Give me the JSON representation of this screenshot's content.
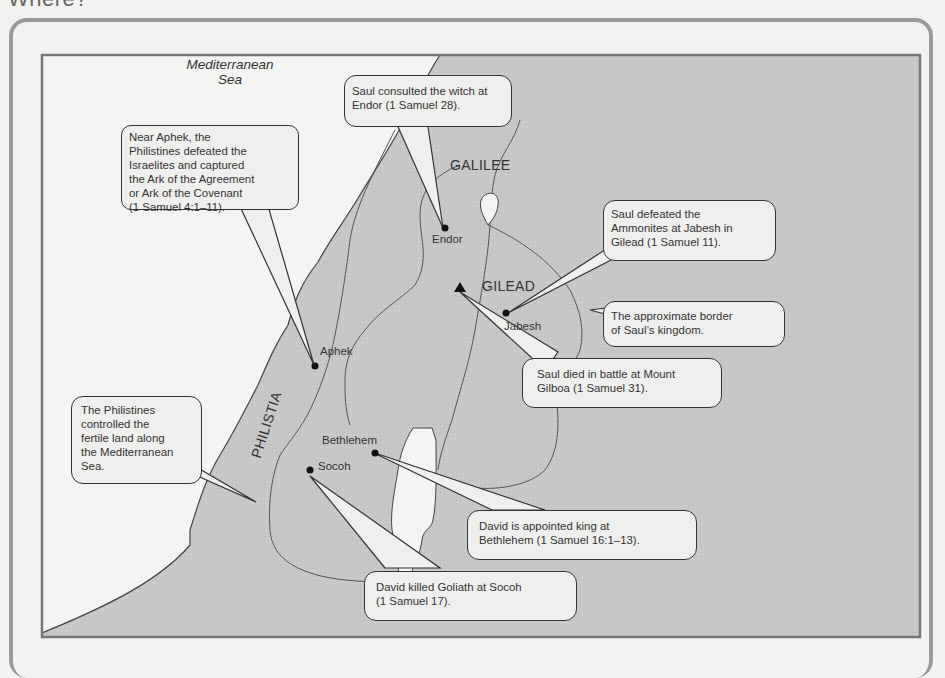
{
  "heading": "Where?",
  "colors": {
    "land": "#c7c7c7",
    "sea": "#f4f4f2",
    "border_line": "#555555",
    "frame": "#777777",
    "callout_fill": "#efefed",
    "callout_stroke": "#333333",
    "marker": "#111111"
  },
  "map": {
    "sea_label": "Mediterranean\nSea",
    "regions": [
      {
        "id": "galilee",
        "label": "GALILEE"
      },
      {
        "id": "gilead",
        "label": "GILEAD"
      },
      {
        "id": "philistia",
        "label": "PHILISTIA"
      }
    ],
    "places": [
      {
        "id": "endor",
        "label": "Endor",
        "marker": "dot"
      },
      {
        "id": "mount-gilboa",
        "label": "",
        "marker": "triangle"
      },
      {
        "id": "jabesh",
        "label": "Jabesh",
        "marker": "dot"
      },
      {
        "id": "aphek",
        "label": "Aphek",
        "marker": "dot"
      },
      {
        "id": "bethlehem",
        "label": "Bethlehem",
        "marker": "dot"
      },
      {
        "id": "socoh",
        "label": "Socoh",
        "marker": "dot"
      }
    ],
    "callouts": [
      {
        "id": "aphek",
        "text": "Near Aphek, the\nPhilistines defeated the\nIsraelites and captured\nthe Ark of the Agreement\nor Ark of the Covenant\n(1 Samuel 4:1–11)."
      },
      {
        "id": "endor",
        "text": "Saul consulted the witch at\nEndor (1 Samuel 28)."
      },
      {
        "id": "jabesh",
        "text": "Saul defeated the\nAmmonites at Jabesh in\nGilead (1 Samuel 11)."
      },
      {
        "id": "border",
        "text": "The approximate border\nof Saul’s kingdom."
      },
      {
        "id": "gilboa",
        "text": "Saul died in battle at Mount\nGilboa (1 Samuel 31)."
      },
      {
        "id": "philistines",
        "text": "The Philistines\ncontrolled the\nfertile land along\nthe Mediterranean\nSea."
      },
      {
        "id": "bethlehem",
        "text": "David is appointed king at\nBethlehem (1 Samuel 16:1–13)."
      },
      {
        "id": "socoh",
        "text": "David killed Goliath at Socoh\n(1 Samuel 17)."
      }
    ]
  }
}
